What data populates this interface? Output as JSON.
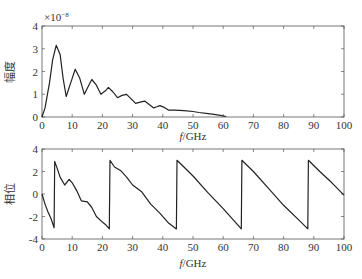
{
  "chart_data": [
    {
      "type": "line",
      "title": "",
      "xlabel": "f/GHz",
      "ylabel": "幅度",
      "y_exponent_label": "×10⁻⁸",
      "xlim": [
        0,
        100
      ],
      "ylim": [
        0,
        4
      ],
      "xticks": [
        0,
        10,
        20,
        30,
        40,
        50,
        60,
        70,
        80,
        90,
        100
      ],
      "yticks": [
        0,
        1,
        2,
        3,
        4
      ],
      "grid": false,
      "series": [
        {
          "name": "amplitude",
          "x": [
            0,
            1,
            2.5,
            3.5,
            4.7,
            6,
            7,
            8,
            9.5,
            11,
            12.5,
            14,
            15.5,
            16.5,
            18,
            19.5,
            21,
            22,
            23.5,
            25,
            26.5,
            28,
            29.5,
            31,
            32.5,
            34,
            35.5,
            37,
            38,
            39,
            40.5,
            42,
            44,
            47,
            50,
            52,
            55,
            57,
            59,
            61
          ],
          "values": [
            0,
            0.4,
            1.5,
            2.5,
            3.15,
            2.75,
            1.7,
            0.9,
            1.5,
            2.1,
            1.7,
            1.0,
            1.4,
            1.65,
            1.4,
            1.0,
            1.15,
            1.3,
            1.1,
            0.85,
            0.95,
            1.0,
            0.8,
            0.6,
            0.65,
            0.7,
            0.55,
            0.4,
            0.45,
            0.5,
            0.42,
            0.3,
            0.3,
            0.28,
            0.24,
            0.2,
            0.15,
            0.12,
            0.07,
            0.02
          ]
        }
      ]
    },
    {
      "type": "line",
      "title": "",
      "xlabel": "f/GHz",
      "ylabel": "相位",
      "xlim": [
        0,
        100
      ],
      "ylim": [
        -4,
        4
      ],
      "xticks": [
        0,
        10,
        20,
        30,
        40,
        50,
        60,
        70,
        80,
        90,
        100
      ],
      "yticks": [
        -4,
        -2,
        0,
        2,
        4
      ],
      "grid": false,
      "series": [
        {
          "name": "phase",
          "x": [
            0,
            1,
            2,
            3,
            4,
            4.2,
            5,
            6,
            7.5,
            9,
            10,
            11.5,
            13,
            15,
            16.5,
            18,
            20,
            21,
            22.3,
            22.5,
            24,
            26,
            28,
            30,
            33,
            36,
            39,
            42,
            44.5,
            44.7,
            47,
            50,
            55,
            60,
            66,
            66.2,
            70,
            75,
            80,
            85,
            88,
            88.2,
            92,
            96,
            100
          ],
          "values": [
            0,
            -0.9,
            -1.6,
            -2.2,
            -3.0,
            2.9,
            2.3,
            1.5,
            0.8,
            1.3,
            1.0,
            0.3,
            -0.6,
            -0.7,
            -1.2,
            -2.0,
            -2.5,
            -2.7,
            -3.1,
            3.0,
            2.4,
            2.1,
            1.5,
            0.8,
            0.2,
            -0.9,
            -1.7,
            -2.6,
            -3.1,
            3.0,
            2.4,
            1.6,
            0.1,
            -1.3,
            -3.1,
            3.0,
            2.0,
            0.5,
            -1.0,
            -2.3,
            -3.1,
            3.0,
            2.0,
            1.0,
            -0.1
          ]
        }
      ]
    }
  ],
  "labels": {
    "top_ylabel": "幅度",
    "bottom_ylabel": "相位",
    "top_exponent": "×10",
    "top_exponent_power": "−8",
    "top_xlabel_f": "f",
    "top_xlabel_rest": "/GHz",
    "bottom_xlabel_f": "f",
    "bottom_xlabel_rest": "/GHz"
  },
  "colors": {
    "line": "#222222",
    "axis": "#555555"
  }
}
